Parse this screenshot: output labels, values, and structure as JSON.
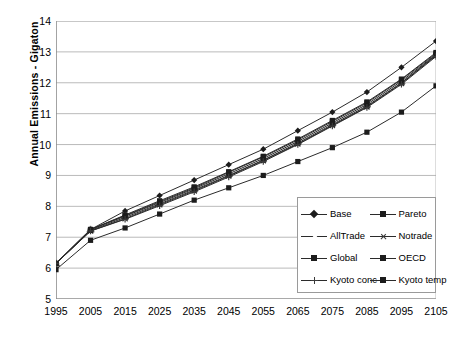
{
  "chart_data": {
    "type": "line",
    "title": "",
    "xlabel": "",
    "ylabel": "Annual Emissions - Gigaton",
    "x": [
      1995,
      2005,
      2015,
      2025,
      2035,
      2045,
      2055,
      2065,
      2075,
      2085,
      2095,
      2105
    ],
    "xticklabels": [
      "1995",
      "2005",
      "2015",
      "2025",
      "2035",
      "2045",
      "2055",
      "2065",
      "2075",
      "2085",
      "2095",
      "2105"
    ],
    "yticklabels": [
      "5",
      "6",
      "7",
      "8",
      "9",
      "10",
      "11",
      "12",
      "13",
      "14"
    ],
    "ylim": [
      5,
      14
    ],
    "ytick_step": 1,
    "grid": "horizontal",
    "legend_position": "inside-lower-right",
    "legend_columns": 2,
    "series": [
      {
        "name": "Base",
        "marker": "diamond",
        "values": [
          6.15,
          7.25,
          7.85,
          8.35,
          8.85,
          9.35,
          9.85,
          10.45,
          11.05,
          11.7,
          12.5,
          13.35
        ]
      },
      {
        "name": "Pareto",
        "marker": "square",
        "values": [
          6.15,
          7.25,
          7.7,
          8.15,
          8.6,
          9.1,
          9.6,
          10.15,
          10.75,
          11.35,
          12.1,
          12.95
        ]
      },
      {
        "name": "AllTrade",
        "marker": "triangle-open",
        "values": [
          6.15,
          7.25,
          7.68,
          8.12,
          8.57,
          9.05,
          9.55,
          10.1,
          10.7,
          11.3,
          12.05,
          12.92
        ]
      },
      {
        "name": "Notrade",
        "marker": "x",
        "values": [
          6.15,
          7.2,
          7.6,
          8.05,
          8.5,
          8.98,
          9.48,
          10.02,
          10.62,
          11.22,
          11.98,
          12.88
        ]
      },
      {
        "name": "Global",
        "marker": "square-filled",
        "values": [
          6.15,
          7.25,
          7.72,
          8.18,
          8.63,
          9.12,
          9.62,
          10.18,
          10.78,
          11.38,
          12.12,
          12.98
        ]
      },
      {
        "name": "OECD",
        "marker": "square-filled",
        "values": [
          6.15,
          7.22,
          7.64,
          8.08,
          8.53,
          9.0,
          9.5,
          10.05,
          10.65,
          11.25,
          12.0,
          12.9
        ]
      },
      {
        "name": "Kyoto conc",
        "marker": "plus",
        "values": [
          6.15,
          7.2,
          7.58,
          8.02,
          8.47,
          8.95,
          9.45,
          10.0,
          10.6,
          11.2,
          11.95,
          12.85
        ]
      },
      {
        "name": "Kyoto temp",
        "marker": "square-filled",
        "values": [
          5.95,
          6.9,
          7.3,
          7.75,
          8.2,
          8.6,
          9.0,
          9.45,
          9.9,
          10.4,
          11.05,
          11.9
        ]
      }
    ]
  },
  "legend": {
    "items": [
      {
        "label": "Base",
        "marker": "diamond"
      },
      {
        "label": "Pareto",
        "marker": "square"
      },
      {
        "label": "AllTrade",
        "marker": "triangle-open"
      },
      {
        "label": "Notrade",
        "marker": "x"
      },
      {
        "label": "Global",
        "marker": "square-filled"
      },
      {
        "label": "OECD",
        "marker": "square-filled"
      },
      {
        "label": "Kyoto conc",
        "marker": "plus"
      },
      {
        "label": "Kyoto temp",
        "marker": "square-filled"
      }
    ]
  },
  "colors": {
    "line": "#2b2b2b",
    "grid": "#a8a8a8",
    "axis": "#8c8c8c",
    "background": "#ffffff"
  }
}
